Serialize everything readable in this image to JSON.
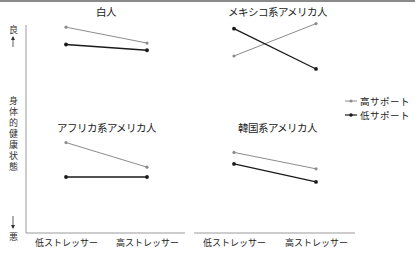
{
  "chart_data": {
    "type": "line",
    "layout": "2x2 small multiples",
    "ylabel": "身体的健康状態",
    "y_top_label": "良",
    "y_bottom_label": "悪",
    "categories": [
      "低ストレッサー",
      "高ストレッサー"
    ],
    "legend": {
      "position": "right",
      "entries": [
        {
          "name": "高サポート",
          "color": "#8c8c8c"
        },
        {
          "name": "低サポート",
          "color": "#1a1a1a"
        }
      ]
    },
    "grid": false,
    "panels": [
      {
        "title": "白人",
        "series": [
          {
            "name": "高サポート",
            "values": [
              0.9,
              0.68
            ]
          },
          {
            "name": "低サポート",
            "values": [
              0.66,
              0.58
            ]
          }
        ]
      },
      {
        "title": "メキシコ系アメリカ人",
        "series": [
          {
            "name": "高サポート",
            "values": [
              0.5,
              0.95
            ]
          },
          {
            "name": "低サポート",
            "values": [
              0.88,
              0.32
            ]
          }
        ]
      },
      {
        "title": "アフリカ系アメリカ人",
        "series": [
          {
            "name": "高サポート",
            "values": [
              0.92,
              0.62
            ]
          },
          {
            "name": "低サポート",
            "values": [
              0.5,
              0.5
            ]
          }
        ]
      },
      {
        "title": "韓国系アメリカ人",
        "series": [
          {
            "name": "高サポート",
            "values": [
              0.8,
              0.6
            ]
          },
          {
            "name": "低サポート",
            "values": [
              0.66,
              0.44
            ]
          }
        ]
      }
    ]
  },
  "colors": {
    "high_support": "#8c8c8c",
    "low_support": "#1a1a1a",
    "axis": "#9a9a9a"
  }
}
